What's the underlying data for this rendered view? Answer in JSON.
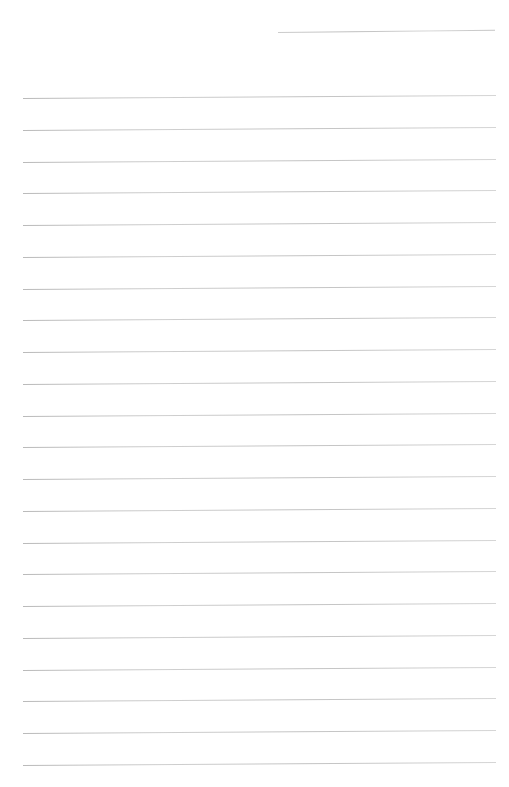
{
  "page": {
    "background": "#ffffff",
    "width": 509,
    "height": 787,
    "text_content": "",
    "header_line": {
      "x": 278,
      "y": 32,
      "width": 217,
      "thickness": 1,
      "color": "#c9c9c9",
      "tilt_deg": -0.6
    },
    "ruled_lines": {
      "count": 22,
      "x": 23,
      "width": 473,
      "start_y": 98,
      "spacing": 31.75,
      "thickness": 1,
      "color": "#c6c6c6",
      "tilt_deg": -0.35
    }
  }
}
